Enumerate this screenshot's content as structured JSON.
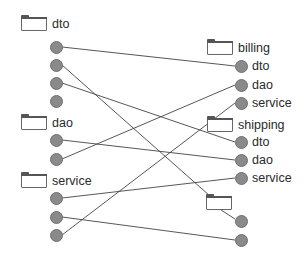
{
  "diagram": {
    "type": "package-dependency-mapping",
    "colors": {
      "line": "#444444",
      "node_fill": "#8a8a8a",
      "node_border": "#6f6f6f",
      "folder_border": "#666666",
      "text": "#2a2a2a"
    },
    "left": {
      "packages": [
        {
          "label": "dto",
          "folder": {
            "x": 21,
            "y": 17
          },
          "label_pos": {
            "x": 52,
            "y": 17
          },
          "nodes": [
            {
              "x": 56,
              "y": 47
            },
            {
              "x": 56,
              "y": 65
            },
            {
              "x": 56,
              "y": 83
            },
            {
              "x": 56,
              "y": 101
            }
          ]
        },
        {
          "label": "dao",
          "folder": {
            "x": 21,
            "y": 116
          },
          "label_pos": {
            "x": 52,
            "y": 116
          },
          "nodes": [
            {
              "x": 56,
              "y": 140
            },
            {
              "x": 56,
              "y": 159
            }
          ]
        },
        {
          "label": "service",
          "folder": {
            "x": 21,
            "y": 174
          },
          "label_pos": {
            "x": 52,
            "y": 174
          },
          "nodes": [
            {
              "x": 56,
              "y": 198
            },
            {
              "x": 56,
              "y": 217
            },
            {
              "x": 56,
              "y": 235
            }
          ]
        }
      ]
    },
    "right": {
      "packages": [
        {
          "label": "billing",
          "folder": {
            "x": 207,
            "y": 41
          },
          "label_pos": {
            "x": 238,
            "y": 41
          },
          "nodes": [
            {
              "x": 241,
              "y": 66,
              "label": "dto"
            },
            {
              "x": 241,
              "y": 85,
              "label": "dao"
            },
            {
              "x": 241,
              "y": 103,
              "label": "service"
            }
          ]
        },
        {
          "label": "shipping",
          "folder": {
            "x": 207,
            "y": 118
          },
          "label_pos": {
            "x": 238,
            "y": 118
          },
          "nodes": [
            {
              "x": 241,
              "y": 142,
              "label": "dto"
            },
            {
              "x": 241,
              "y": 160,
              "label": "dao"
            },
            {
              "x": 241,
              "y": 178,
              "label": "service"
            }
          ]
        },
        {
          "label": "",
          "folder": {
            "x": 206,
            "y": 196
          },
          "label_pos": {
            "x": 238,
            "y": 196
          },
          "nodes": [
            {
              "x": 241,
              "y": 221,
              "label": ""
            },
            {
              "x": 241,
              "y": 240,
              "label": ""
            }
          ]
        }
      ]
    },
    "edges": [
      {
        "from": "left.dto.1",
        "to": "billing.dto",
        "x1": 62,
        "y1": 47,
        "x2": 235,
        "y2": 66
      },
      {
        "from": "left.dto.2",
        "to": "unnamed-folder",
        "x1": 62,
        "y1": 65,
        "x2": 210,
        "y2": 196
      },
      {
        "from": "left.dto.3",
        "to": "shipping.dto",
        "x1": 62,
        "y1": 83,
        "x2": 235,
        "y2": 142
      },
      {
        "from": "left.dao.1",
        "to": "shipping.dao",
        "x1": 62,
        "y1": 140,
        "x2": 235,
        "y2": 160
      },
      {
        "from": "left.dao.2",
        "to": "billing.dao",
        "x1": 62,
        "y1": 159,
        "x2": 235,
        "y2": 85
      },
      {
        "from": "left.service.1",
        "to": "shipping.service",
        "x1": 62,
        "y1": 198,
        "x2": 235,
        "y2": 178
      },
      {
        "from": "left.service.2",
        "to": "unnamed.2",
        "x1": 62,
        "y1": 217,
        "x2": 235,
        "y2": 240
      },
      {
        "from": "left.service.3",
        "to": "billing.service",
        "x1": 62,
        "y1": 235,
        "x2": 235,
        "y2": 103
      },
      {
        "from": "unnamed-folder",
        "to": "unnamed.1",
        "x1": 221,
        "y1": 210,
        "x2": 235,
        "y2": 219
      }
    ]
  }
}
